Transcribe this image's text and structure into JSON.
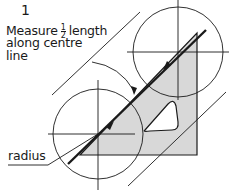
{
  "diagram": {
    "step_number": "1",
    "instruction": {
      "line1_pre": "Measure",
      "fraction_num": "1",
      "fraction_den": "2",
      "line1_post": "length",
      "line2": "along centre",
      "line3": "line"
    },
    "radius_label": "radius",
    "colors": {
      "stroke": "#1a1a1a",
      "fill": "#d8d8d8",
      "background": "#ffffff"
    }
  }
}
